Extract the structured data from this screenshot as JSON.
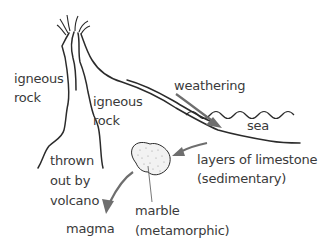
{
  "diagram": {
    "type": "rock-cycle",
    "colors": {
      "line": "#2b2b2b",
      "arrow": "#6e6e6e",
      "text": "#3a3a3a",
      "marble_fill": "#f2f2f2"
    },
    "labels": {
      "igneous_left": [
        "igneous",
        "rock"
      ],
      "igneous_right": [
        "igneous",
        "rock"
      ],
      "weathering": "weathering",
      "sea": "sea",
      "limestone": [
        "layers of limestone",
        "(sedimentary)"
      ],
      "thrown": [
        "thrown",
        "out by",
        "volcano"
      ],
      "magma": "magma",
      "marble": [
        "marble",
        "(metamorphic)"
      ]
    },
    "arrows": [
      {
        "from": "igneous rock",
        "to": "sea",
        "label": "weathering"
      },
      {
        "from": "layers of limestone",
        "to": "marble"
      },
      {
        "from": "marble",
        "to": "magma"
      }
    ]
  }
}
